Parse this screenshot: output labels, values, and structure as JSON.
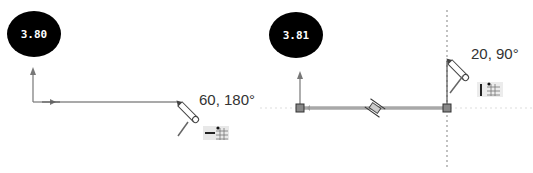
{
  "panels": [
    {
      "id": "left",
      "dimension_badge": "3.80",
      "cursor_readout": "60, 180°",
      "inference_icon": "horizontal-relation-grid-icon"
    },
    {
      "id": "right",
      "dimension_badge": "3.81",
      "cursor_readout": "20, 90°",
      "inference_icon": "vertical-relation-grid-icon"
    }
  ],
  "colors": {
    "badge_bg": "#000000",
    "badge_text": "#ffffff",
    "sketch_line": "#555555",
    "inference_line": "#9a9a9a",
    "highlight_line": "#a8a8a8"
  }
}
